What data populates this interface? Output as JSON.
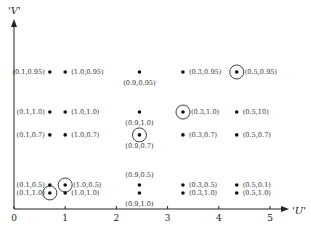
{
  "chart_data": {
    "type": "scatter",
    "title": "",
    "xlabel": "'U'",
    "ylabel": "'V'",
    "xlim": [
      0,
      5.4
    ],
    "ylim": [
      0,
      10
    ],
    "x_ticks": [
      "0",
      "1",
      "2",
      "3",
      "4",
      "5"
    ],
    "y_ticks": [],
    "grid": false,
    "points": [
      {
        "x": 0.7,
        "y": 7.25,
        "label": "(0.1,0.95)",
        "label_pos": "left",
        "circled": false
      },
      {
        "x": 1.0,
        "y": 7.25,
        "label": "(1.0,0.95)",
        "label_pos": "right",
        "circled": false
      },
      {
        "x": 2.45,
        "y": 7.25,
        "label": "(0.9,0.95)",
        "label_pos": "below",
        "circled": false
      },
      {
        "x": 3.3,
        "y": 7.25,
        "label": "(0.3,0.95)",
        "label_pos": "right",
        "circled": false
      },
      {
        "x": 4.35,
        "y": 7.25,
        "label": "(0.5,0.95)",
        "label_pos": "right",
        "circled": true
      },
      {
        "x": 0.7,
        "y": 5.13,
        "label": "(0.1,1.0)",
        "label_pos": "left",
        "circled": false
      },
      {
        "x": 1.0,
        "y": 5.13,
        "label": "(1.0,1.0)",
        "label_pos": "right",
        "circled": false
      },
      {
        "x": 2.45,
        "y": 5.13,
        "label": "(0.9,1.0)",
        "label_pos": "below",
        "circled": false
      },
      {
        "x": 3.3,
        "y": 5.13,
        "label": "(0.3,1.0)",
        "label_pos": "right",
        "circled": true
      },
      {
        "x": 4.35,
        "y": 5.13,
        "label": "(0.5,10)",
        "label_pos": "right",
        "circled": false
      },
      {
        "x": 0.7,
        "y": 3.92,
        "label": "(0.1,0.7)",
        "label_pos": "left",
        "circled": false
      },
      {
        "x": 1.0,
        "y": 3.92,
        "label": "(1.0,0.7)",
        "label_pos": "right",
        "circled": false
      },
      {
        "x": 2.45,
        "y": 3.92,
        "label": "(0.9,0.7)",
        "label_pos": "below",
        "circled": true
      },
      {
        "x": 3.3,
        "y": 3.92,
        "label": "(0.3,0.7)",
        "label_pos": "right",
        "circled": false
      },
      {
        "x": 4.35,
        "y": 3.92,
        "label": "(0.5,0.7)",
        "label_pos": "right",
        "circled": false
      },
      {
        "x": 0.7,
        "y": 1.27,
        "label": "(0.1,0.5)",
        "label_pos": "left",
        "circled": false
      },
      {
        "x": 1.0,
        "y": 1.27,
        "label": "(1.0,0.5)",
        "label_pos": "right",
        "circled": true
      },
      {
        "x": 2.45,
        "y": 1.27,
        "label": "(0.9,0.5)",
        "label_pos": "above",
        "circled": false
      },
      {
        "x": 3.3,
        "y": 1.27,
        "label": "(0.3,0.5)",
        "label_pos": "right",
        "circled": false
      },
      {
        "x": 4.35,
        "y": 1.27,
        "label": "(0.5,0.1)",
        "label_pos": "right",
        "circled": false
      },
      {
        "x": 0.7,
        "y": 0.85,
        "label": "(0.1,1.0)",
        "label_pos": "left",
        "circled": true
      },
      {
        "x": 1.0,
        "y": 0.85,
        "label": "(1.0,1.0)",
        "label_pos": "right",
        "circled": false
      },
      {
        "x": 2.45,
        "y": 0.85,
        "label": "(0.9,1.0)",
        "label_pos": "below",
        "circled": false
      },
      {
        "x": 3.3,
        "y": 0.85,
        "label": "(0.3,1.0)",
        "label_pos": "right",
        "circled": false
      },
      {
        "x": 4.35,
        "y": 0.85,
        "label": "(0.5,1.0)",
        "label_pos": "right",
        "circled": false
      }
    ],
    "colors": {
      "axis": "#222222",
      "point": "#111111",
      "label": "#333333"
    }
  }
}
